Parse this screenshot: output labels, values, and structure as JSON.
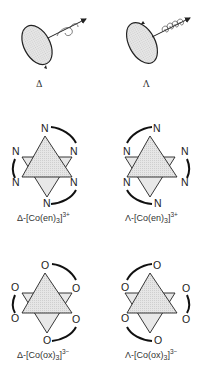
{
  "figure": {
    "top_row": [
      {
        "id": "delta-helix",
        "label": "Δ",
        "description": "disk with right-handed helical arrow"
      },
      {
        "id": "lambda-helix",
        "label": "Λ",
        "description": "disk with left-handed helical arrow"
      }
    ],
    "complexes": [
      {
        "id": "delta-co-en",
        "prefix": "Δ-[Co(en)",
        "sub": "3",
        "close": "]",
        "charge": "3+",
        "atom": "N"
      },
      {
        "id": "lambda-co-en",
        "prefix": "Λ-[Co(en)",
        "sub": "3",
        "close": "]",
        "charge": "3+",
        "atom": "N"
      },
      {
        "id": "delta-co-ox",
        "prefix": "Δ-[Co(ox)",
        "sub": "3",
        "close": "]",
        "charge": "3−",
        "atom": "O"
      },
      {
        "id": "lambda-co-ox",
        "prefix": "Λ-[Co(ox)",
        "sub": "3",
        "close": "]",
        "charge": "3−",
        "atom": "O"
      }
    ]
  },
  "colors": {
    "fill": "#dcdcdc",
    "line": "#222222"
  }
}
